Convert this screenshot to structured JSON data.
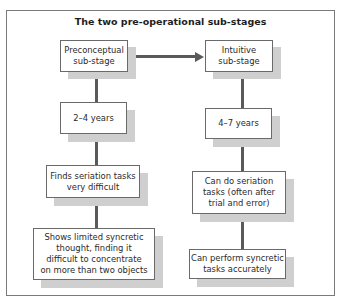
{
  "diagram": {
    "title": "The two pre-operational sub-stages",
    "left_column": {
      "stage": "Preconceptual\nsub-stage",
      "age": "2–4 years",
      "seriation": "Finds seriation tasks\nvery difficult",
      "syncretic": "Shows limited syncretic\nthought, finding it\ndifficult to concentrate\non more than two objects"
    },
    "right_column": {
      "stage": "Intuitive\nsub-stage",
      "age": "4–7 years",
      "seriation": "Can do seriation\ntasks (often after\ntrial and error)",
      "syncretic": "Can perform syncretic\ntasks accurately"
    },
    "connector": "arrow-right",
    "colors": {
      "line": "#5a5a5a",
      "box_border": "#6a6a6a",
      "shadow": "#cfcfcf",
      "frame": "#7a7a7a"
    }
  }
}
